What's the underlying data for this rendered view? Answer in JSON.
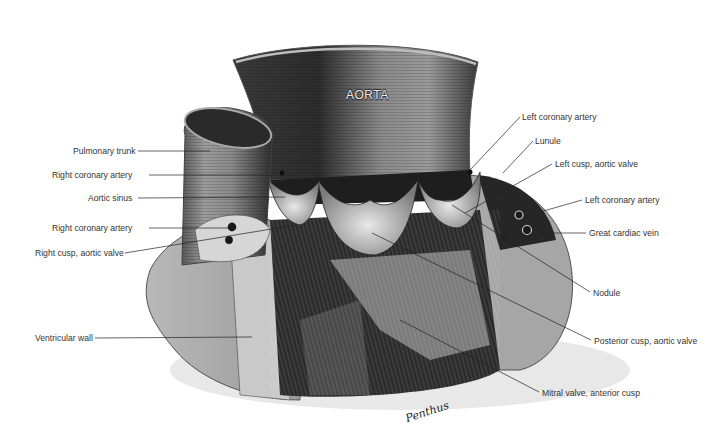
{
  "figure": {
    "title": "AORTA",
    "signature": "Penthus",
    "background": "#ffffff",
    "line_color": "#222222"
  },
  "labels": {
    "left": [
      {
        "id": "pulmonary-trunk",
        "text": "Pulmonary trunk",
        "x": 73,
        "y": 147,
        "line_to": [
          210,
          151
        ]
      },
      {
        "id": "right-coronary-artery-1",
        "text": "Right coronary artery",
        "x": 52,
        "y": 170,
        "line_to": [
          278,
          175
        ]
      },
      {
        "id": "aortic-sinus",
        "text": "Aortic sinus",
        "x": 88,
        "y": 193,
        "line_to": [
          285,
          197
        ]
      },
      {
        "id": "right-coronary-artery-2",
        "text": "Right coronary artery",
        "x": 52,
        "y": 223,
        "line_to": [
          230,
          228
        ]
      },
      {
        "id": "right-cusp-aortic-valve",
        "text": "Right cusp, aortic valve",
        "x": 35,
        "y": 248,
        "line_to": [
          296,
          225
        ]
      },
      {
        "id": "ventricular-wall",
        "text": "Ventricular wall",
        "x": 35,
        "y": 333,
        "line_to": [
          252,
          337
        ]
      }
    ],
    "right": [
      {
        "id": "left-coronary-artery-1",
        "text": "Left coronary artery",
        "x": 522,
        "y": 112,
        "line_to": [
          470,
          170
        ]
      },
      {
        "id": "lunule",
        "text": "Lunule",
        "x": 535,
        "y": 136,
        "line_to": [
          503,
          173
        ]
      },
      {
        "id": "left-cusp-aortic-valve",
        "text": "Left cusp, aortic valve",
        "x": 555,
        "y": 159,
        "line_to": [
          465,
          213
        ]
      },
      {
        "id": "left-coronary-artery-2",
        "text": "Left coronary artery",
        "x": 585,
        "y": 195,
        "line_to": [
          526,
          216
        ]
      },
      {
        "id": "great-cardiac-vein",
        "text": "Great cardiac vein",
        "x": 589,
        "y": 228,
        "line_to": [
          540,
          233
        ]
      },
      {
        "id": "nodule",
        "text": "Nodule",
        "x": 593,
        "y": 288,
        "line_to": [
          452,
          205
        ]
      },
      {
        "id": "posterior-cusp-aortic-valve",
        "text": "Posterior cusp, aortic valve",
        "x": 594,
        "y": 336,
        "line_to": [
          372,
          233
        ]
      },
      {
        "id": "mitral-valve-anterior-cusp",
        "text": "Mitral valve, anterior cusp",
        "x": 542,
        "y": 388,
        "line_to": [
          400,
          320
        ]
      }
    ]
  }
}
